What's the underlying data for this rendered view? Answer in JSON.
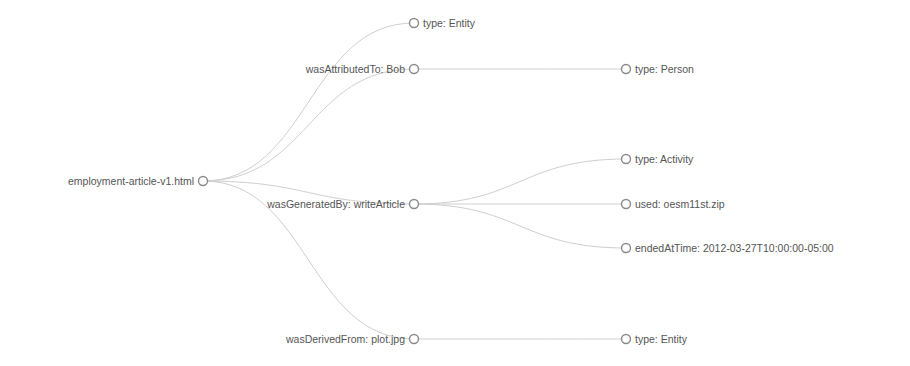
{
  "diagram": {
    "type": "tree",
    "orientation": "left-to-right",
    "colors": {
      "link": "#cfcfcf",
      "node_stroke": "#8a8a8a",
      "node_fill": "#ffffff",
      "label": "#555555"
    },
    "root": {
      "id": "root",
      "label": "employment-article-v1.html",
      "x": 203,
      "y": 181,
      "label_side": "left"
    },
    "nodes": [
      {
        "id": "n_type_entity_top",
        "label": "type: Entity",
        "x": 414,
        "y": 23,
        "parent": "root",
        "label_side": "right"
      },
      {
        "id": "n_attributed",
        "label": "wasAttributedTo: Bob",
        "x": 414,
        "y": 69,
        "parent": "root",
        "label_side": "left"
      },
      {
        "id": "n_generated",
        "label": "wasGeneratedBy: writeArticle",
        "x": 414,
        "y": 204,
        "parent": "root",
        "label_side": "left"
      },
      {
        "id": "n_derived",
        "label": "wasDerivedFrom: plot.jpg",
        "x": 414,
        "y": 339,
        "parent": "root",
        "label_side": "left"
      },
      {
        "id": "n_type_person",
        "label": "type: Person",
        "x": 626,
        "y": 69,
        "parent": "n_attributed",
        "label_side": "right"
      },
      {
        "id": "n_type_activity",
        "label": "type: Activity",
        "x": 626,
        "y": 159,
        "parent": "n_generated",
        "label_side": "right"
      },
      {
        "id": "n_used",
        "label": "used: oesm11st.zip",
        "x": 626,
        "y": 204,
        "parent": "n_generated",
        "label_side": "right"
      },
      {
        "id": "n_ended",
        "label": "endedAtTime: 2012-03-27T10:00:00-05:00",
        "x": 626,
        "y": 248,
        "parent": "n_generated",
        "label_side": "right"
      },
      {
        "id": "n_type_entity_bottom",
        "label": "type: Entity",
        "x": 626,
        "y": 339,
        "parent": "n_derived",
        "label_side": "right"
      }
    ]
  }
}
